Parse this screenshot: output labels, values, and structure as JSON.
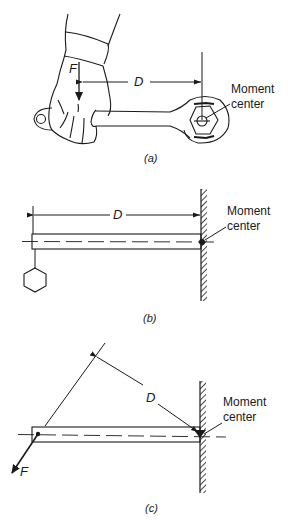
{
  "panels": [
    {
      "id": "a",
      "caption": "(a)",
      "force_label": "F",
      "distance_label": "D",
      "moment_center_label_line1": "Moment",
      "moment_center_label_line2": "center",
      "description": "Hand applying downward force F on wrench handle; D measured horizontally to nut center"
    },
    {
      "id": "b",
      "caption": "(b)",
      "distance_label": "D",
      "moment_center_label_line1": "Moment",
      "moment_center_label_line2": "center",
      "description": "Cantilever beam fixed to wall with hanging hexagonal weight at free end"
    },
    {
      "id": "c",
      "caption": "(c)",
      "force_label": "F",
      "distance_label": "D",
      "moment_center_label_line1": "Moment",
      "moment_center_label_line2": "center",
      "description": "Cantilever beam with inclined force F; D is perpendicular distance from line of action to moment center"
    }
  ],
  "colors": {
    "ink": "#1a1a1a",
    "background": "#ffffff"
  }
}
